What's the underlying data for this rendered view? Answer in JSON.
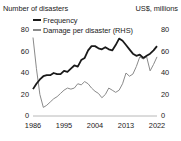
{
  "chart_data": {
    "type": "line",
    "title": "",
    "left_axis_title": "Number of disasters",
    "right_axis_title": "US$, millions",
    "xlabel": "",
    "ylabel": "Number of disasters",
    "y2label": "US$, millions",
    "ylim": [
      0,
      80
    ],
    "y2lim": [
      0,
      80
    ],
    "yticks": [
      0,
      20,
      40,
      60,
      80
    ],
    "y2ticks": [
      0,
      20,
      40,
      60,
      80
    ],
    "xlim": [
      1986,
      2022
    ],
    "xticks": [
      1986,
      1995,
      2004,
      2013,
      2022
    ],
    "xticklabels": [
      "1986",
      "1995",
      "2004",
      "2013",
      "2022"
    ],
    "grid": false,
    "legend_position": "top-left",
    "x": [
      1986,
      1987,
      1988,
      1989,
      1990,
      1991,
      1992,
      1993,
      1994,
      1995,
      1996,
      1997,
      1998,
      1999,
      2000,
      2001,
      2002,
      2003,
      2004,
      2005,
      2006,
      2007,
      2008,
      2009,
      2010,
      2011,
      2012,
      2013,
      2014,
      2015,
      2016,
      2017,
      2018,
      2019,
      2020,
      2021,
      2022
    ],
    "series": [
      {
        "name": "Frequency",
        "axis": "left",
        "color": "#1a1a1a",
        "values": [
          25,
          30,
          34,
          37,
          38,
          38,
          40,
          39,
          39,
          42,
          41,
          44,
          47,
          46,
          52,
          54,
          61,
          65,
          65,
          63,
          62,
          64,
          62,
          61,
          66,
          72,
          70,
          66,
          62,
          58,
          56,
          57,
          54,
          56,
          58,
          61,
          65
        ]
      },
      {
        "name": "Damage per disaster (RHS)",
        "axis": "right",
        "color": "#8a8a8a",
        "values": [
          73,
          44,
          20,
          8,
          10,
          13,
          16,
          18,
          21,
          24,
          26,
          25,
          26,
          30,
          29,
          32,
          30,
          26,
          23,
          21,
          17,
          20,
          26,
          24,
          22,
          24,
          30,
          40,
          37,
          39,
          46,
          55,
          53,
          55,
          42,
          48,
          55
        ]
      }
    ],
    "legend": [
      {
        "label": "Frequency",
        "color": "#1a1a1a",
        "style": "thick-solid"
      },
      {
        "label": "Damage per disaster (RHS)",
        "color": "#8a8a8a",
        "style": "thin-solid"
      }
    ],
    "annotations": []
  }
}
